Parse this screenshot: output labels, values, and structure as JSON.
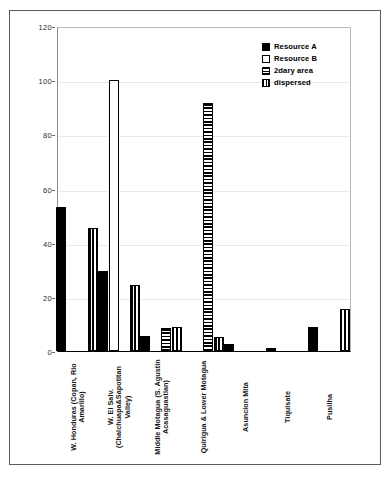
{
  "chart_data": {
    "type": "bar",
    "title": "",
    "subtitle": "",
    "xlabel": "",
    "ylabel": "",
    "ylim": [
      0,
      120
    ],
    "ytick_step": 20,
    "yticks": [
      0,
      20,
      40,
      60,
      80,
      100,
      120
    ],
    "ytick_labels": [
      "0",
      "20",
      "40",
      "60",
      "80",
      "100",
      "120"
    ],
    "grid": true,
    "legend_position": "top-right",
    "categories": [
      "W. Honduras (Copan, Rio Amarillo)",
      "W. El Salv. (Chalchuapa&Sapotitan Valley)",
      "Middle Motagua (S. Agustin Acasaguastlan)",
      "Quirigua & Lower Motagua",
      "Asuncion Mita",
      "Tiquisate",
      "Pusilha"
    ],
    "series": [
      {
        "name": "Resource A",
        "fill": "solid-black",
        "color": "#000000",
        "values": [
          53,
          29.5,
          5.5,
          null,
          2.5,
          1,
          9
        ]
      },
      {
        "name": "Resource B",
        "fill": "open-white",
        "color": "#ffffff",
        "values": [
          null,
          100,
          null,
          null,
          null,
          null,
          null
        ]
      },
      {
        "name": "2dary area",
        "fill": "horizontal-stripes",
        "color": "#000000",
        "values": [
          null,
          null,
          8.5,
          91.5,
          null,
          null,
          null
        ]
      },
      {
        "name": "dispersed",
        "fill": "vertical-stripes",
        "color": "#000000",
        "values": [
          45.5,
          24.5,
          9,
          5,
          null,
          null,
          15.5
        ]
      }
    ]
  },
  "legend": {
    "entries": [
      {
        "label": "Resource A",
        "swatch": "solid-black-swatch"
      },
      {
        "label": "Resource B",
        "swatch": "open-white-swatch"
      },
      {
        "label": "2dary area",
        "swatch": "horizontal-stripe-swatch"
      },
      {
        "label": "dispersed",
        "swatch": "vertical-stripe-swatch"
      }
    ]
  },
  "colors": {
    "series_black": "#000000",
    "series_white": "#ffffff",
    "axis": "#000000",
    "grid": "#e9e9e9",
    "frame": "#5a5a5a",
    "background": "#ffffff"
  }
}
